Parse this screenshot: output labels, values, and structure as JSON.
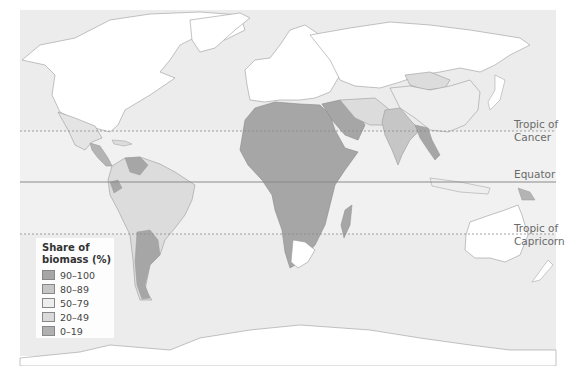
{
  "map": {
    "title": "Share of biomass in energy consumption by country",
    "colors": {
      "ocean": "#ececec",
      "ocean_band": "#f2f2f2",
      "no_data": "#ffffff",
      "border": "#9a9a9a",
      "c90_100": "#a6a6a6",
      "c80_89": "#c6c6c6",
      "c50_79": "#e8e8e8",
      "c20_49": "#dcdcdc",
      "c0_19": "#b4b4b4",
      "line": "#8a8a8a"
    },
    "lines": [
      {
        "id": "tropic-cancer",
        "label_line1": "Tropic of",
        "label_line2": "Cancer",
        "style": "dotted"
      },
      {
        "id": "equator",
        "label": "Equator",
        "style": "solid"
      },
      {
        "id": "tropic-capricorn",
        "label_line1": "Tropic of",
        "label_line2": "Capricorn",
        "style": "dotted"
      }
    ]
  },
  "legend": {
    "title_line1": "Share of",
    "title_line2": "biomass (%)",
    "items": [
      {
        "label": "90–100",
        "color": "#a6a6a6"
      },
      {
        "label": "80–89",
        "color": "#c6c6c6"
      },
      {
        "label": "50–79",
        "color": "#eeeeee"
      },
      {
        "label": "20–49",
        "color": "#dadada"
      },
      {
        "label": "0–19",
        "color": "#b0b0b0"
      }
    ]
  }
}
